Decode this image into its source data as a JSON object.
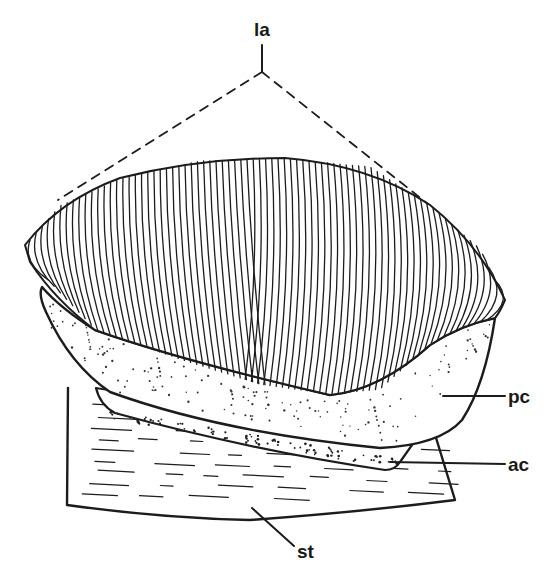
{
  "figure": {
    "type": "anatomical line drawing",
    "ink_color": "#1c1c1c",
    "background": "#ffffff"
  },
  "labels": [
    {
      "id": "la",
      "text": "la",
      "x": 262,
      "y": 30
    },
    {
      "id": "pc",
      "text": "pc",
      "x": 510,
      "y": 402
    },
    {
      "id": "ac",
      "text": "ac",
      "x": 510,
      "y": 470
    },
    {
      "id": "st",
      "text": "st",
      "x": 300,
      "y": 556
    }
  ]
}
